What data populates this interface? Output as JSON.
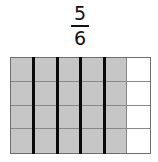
{
  "fraction": {
    "numerator": "5",
    "denominator": "6"
  },
  "grid": {
    "rows": 4,
    "cols": 6,
    "shaded_cols": 5,
    "shaded_color": "#c6c6c6",
    "empty_color": "#ffffff",
    "thick_divider_after_cols": [
      1,
      2,
      3,
      4
    ]
  }
}
